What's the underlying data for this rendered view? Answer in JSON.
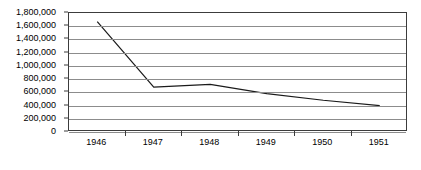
{
  "chart_data": {
    "type": "line",
    "title": "",
    "subtitle": "",
    "xlabel": "",
    "ylabel": "",
    "categories": [
      "1946",
      "1947",
      "1948",
      "1949",
      "1950",
      "1951"
    ],
    "series": [
      {
        "name": "",
        "values": [
          1670000,
          680000,
          720000,
          580000,
          480000,
          400000
        ]
      }
    ],
    "ylim": [
      0,
      1800000
    ],
    "ytick_step": 200000,
    "ytick_labels": [
      "1,800,000",
      "1,600,000",
      "1,400,000",
      "1,200,000",
      "1,000,000",
      "800,000",
      "600,000",
      "400,000",
      "200,000",
      "0"
    ],
    "ytick_values": [
      1800000,
      1600000,
      1400000,
      1200000,
      1000000,
      800000,
      600000,
      400000,
      200000,
      0
    ],
    "grid": "horizontal",
    "legend": "none",
    "annotations": [],
    "colors": {
      "line": "#1a1a1a",
      "grid": "#8c8c8c",
      "border": "#3c3c3c",
      "background": "#ffffff",
      "text": "#000000"
    }
  }
}
